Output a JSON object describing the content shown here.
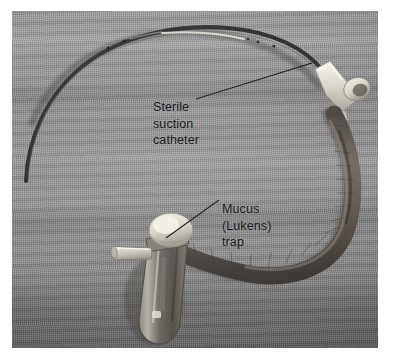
{
  "figure": {
    "kind": "photograph",
    "palette": {
      "plate_border": "#ffffff",
      "cloth_background": "#8d8d8d",
      "tubing": "#5c5651",
      "catheter": "#3b3a38",
      "connector_plastic": "#e7e4dc",
      "trap_cap": "#e2e0d6",
      "trap_body": "#6f6a64",
      "label_text": "#16181a",
      "leader_line": "#1a1c1e"
    }
  },
  "annotations": [
    {
      "id": "sterile-suction-catheter",
      "lines": [
        "Sterile",
        "suction",
        "catheter"
      ],
      "leader": {
        "from_x": 196,
        "from_y": 99,
        "to_x": 312,
        "to_y": 63
      }
    },
    {
      "id": "mucus-lukens-trap",
      "lines": [
        "Mucus",
        "(Lukens)",
        "trap"
      ],
      "leader": {
        "from_x": 219,
        "from_y": 200,
        "to_x": 166,
        "to_y": 238
      }
    }
  ],
  "objects": [
    {
      "name": "suction-catheter-tube",
      "description": "thin flexible dark catheter curving from lower left up and over to the right connector"
    },
    {
      "name": "y-connector",
      "description": "white plastic thumb-port connector at upper right joining catheter to corrugated tubing"
    },
    {
      "name": "corrugated-suction-tubing",
      "description": "thick dark gray tubing looping down the right side into the trap"
    },
    {
      "name": "lukens-trap-vial",
      "description": "clear specimen vial with white screw cap and angled side port at lower center"
    },
    {
      "name": "trap-side-port",
      "description": "light colored angled side connector on the left of the trap"
    }
  ]
}
